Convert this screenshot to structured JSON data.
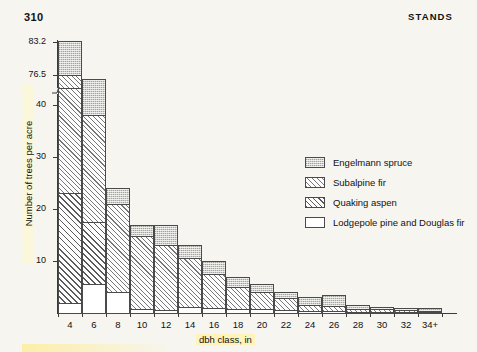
{
  "page": {
    "number": "310",
    "running_head": "STANDS"
  },
  "chart_data": {
    "type": "bar",
    "subtype": "stacked",
    "title": "",
    "xlabel": "dbh class, in",
    "ylabel": "Number of trees per acre",
    "categories": [
      "4",
      "6",
      "8",
      "10",
      "12",
      "14",
      "16",
      "18",
      "20",
      "22",
      "24",
      "26",
      "28",
      "30",
      "32",
      "34+"
    ],
    "ylim": [
      0,
      45
    ],
    "y_ticks": [
      10,
      20,
      30,
      40
    ],
    "y_ticks_upper": [
      76.5,
      83.2
    ],
    "axis_break": true,
    "axis_break_note": "y-axis broken between 45 and 76.5",
    "grid": false,
    "legend_position": "right",
    "series": [
      {
        "name": "Lodgepole pine and Douglas fir",
        "pattern": "white",
        "values": [
          2.0,
          5.5,
          4.0,
          0.8,
          0.5,
          1.2,
          1.0,
          0.8,
          0.8,
          0.6,
          0.4,
          0.3,
          0.2,
          0.2,
          0.1,
          0.1
        ]
      },
      {
        "name": "Quaking aspen",
        "pattern": "coarse-diagonal-hatch",
        "values": [
          21.0,
          12.0,
          0.0,
          0.0,
          0.0,
          0.0,
          0.0,
          0.0,
          0.0,
          0.0,
          0.0,
          0.0,
          0.0,
          0.0,
          0.0,
          0.0
        ]
      },
      {
        "name": "Subalpine fir",
        "pattern": "fine-diagonal-hatch",
        "values": [
          53.5,
          20.5,
          17.0,
          14.0,
          12.5,
          9.3,
          6.5,
          4.2,
          3.2,
          2.2,
          1.1,
          1.0,
          0.6,
          0.5,
          0.4,
          0.3
        ]
      },
      {
        "name": "Engelmann spruce",
        "pattern": "stipple",
        "values": [
          6.7,
          7.0,
          3.0,
          2.2,
          4.0,
          2.5,
          2.5,
          2.0,
          1.5,
          1.2,
          1.5,
          2.2,
          0.7,
          0.5,
          0.5,
          0.5
        ]
      }
    ],
    "totals": [
      83.2,
      45.0,
      24.0,
      17.0,
      17.0,
      13.0,
      10.0,
      7.0,
      5.5,
      4.0,
      3.0,
      3.5,
      1.5,
      1.2,
      1.0,
      0.9
    ]
  },
  "legend": {
    "items": [
      {
        "label": "Engelmann spruce",
        "pattern": "spruce"
      },
      {
        "label": "Subalpine fir",
        "pattern": "subalpine"
      },
      {
        "label": "Quaking aspen",
        "pattern": "aspen"
      },
      {
        "label": "Lodgepole pine and Douglas fir",
        "pattern": "lodgepole"
      }
    ]
  }
}
